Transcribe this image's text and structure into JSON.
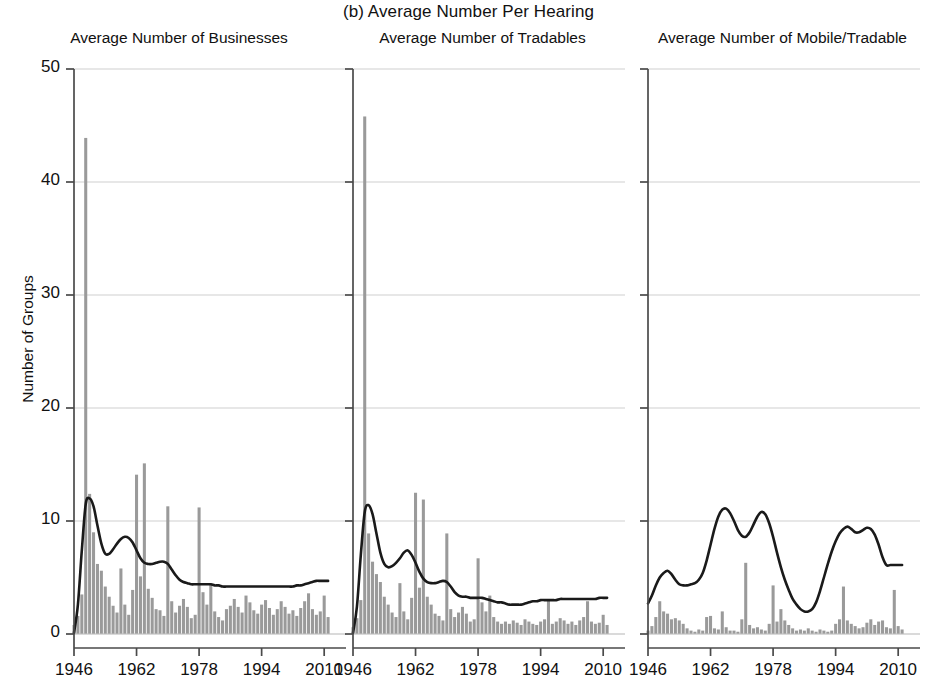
{
  "figure": {
    "main_title": "(b) Average Number Per Hearing",
    "ylabel": "Number of Groups",
    "y_ticks": [
      "0",
      "10",
      "20",
      "30",
      "40",
      "50"
    ],
    "x_ticks": [
      "1946",
      "1962",
      "1978",
      "1994",
      "2010"
    ]
  },
  "chart_data": {
    "type": "bar",
    "title": "(b) Average Number Per Hearing",
    "xlabel": "",
    "ylabel": "Number of Groups",
    "ylim": [
      0,
      50
    ],
    "xlim": [
      1946,
      2012
    ],
    "grid": true,
    "legend": "none",
    "y_tick_values": [
      0,
      10,
      20,
      30,
      40,
      50
    ],
    "x_tick_values": [
      1946,
      1962,
      1978,
      1994,
      2010
    ],
    "panels": [
      {
        "title": "Average Number of Businesses",
        "bar_series_name": "Average Number of Businesses",
        "line_series_name": "smoothed trend",
        "x": [
          1946,
          1947,
          1948,
          1949,
          1950,
          1951,
          1952,
          1953,
          1954,
          1955,
          1956,
          1957,
          1958,
          1959,
          1960,
          1961,
          1962,
          1963,
          1964,
          1965,
          1966,
          1967,
          1968,
          1969,
          1970,
          1971,
          1972,
          1973,
          1974,
          1975,
          1976,
          1977,
          1978,
          1979,
          1980,
          1981,
          1982,
          1983,
          1984,
          1985,
          1986,
          1987,
          1988,
          1989,
          1990,
          1991,
          1992,
          1993,
          1994,
          1995,
          1996,
          1997,
          1998,
          1999,
          2000,
          2001,
          2002,
          2003,
          2004,
          2005,
          2006,
          2007,
          2008,
          2009,
          2010,
          2011
        ],
        "bars": [
          0.8,
          1.6,
          3.5,
          43.9,
          12.4,
          9.0,
          6.2,
          5.6,
          4.2,
          3.3,
          2.5,
          1.9,
          5.8,
          2.6,
          1.7,
          3.9,
          14.1,
          5.1,
          15.1,
          4.0,
          3.2,
          2.2,
          2.1,
          1.6,
          11.3,
          2.9,
          1.9,
          2.5,
          3.1,
          2.4,
          1.4,
          1.7,
          11.2,
          3.7,
          2.6,
          4.5,
          2.0,
          1.5,
          1.2,
          2.2,
          2.5,
          3.1,
          2.4,
          1.9,
          3.4,
          2.8,
          2.1,
          1.8,
          2.6,
          3.0,
          2.3,
          1.7,
          2.2,
          2.9,
          2.4,
          1.8,
          2.1,
          1.6,
          2.3,
          2.9,
          3.6,
          2.2,
          1.7,
          2.0,
          3.4,
          1.5
        ],
        "line": [
          0.1,
          2.6,
          7.4,
          11.5,
          12.0,
          11.3,
          9.6,
          8.0,
          7.1,
          7.1,
          7.5,
          8.0,
          8.4,
          8.6,
          8.5,
          8.1,
          7.4,
          6.7,
          6.3,
          6.2,
          6.2,
          6.3,
          6.4,
          6.4,
          6.2,
          5.7,
          5.2,
          4.8,
          4.6,
          4.5,
          4.4,
          4.4,
          4.4,
          4.4,
          4.4,
          4.4,
          4.3,
          4.3,
          4.2,
          4.2,
          4.2,
          4.2,
          4.2,
          4.2,
          4.2,
          4.2,
          4.2,
          4.2,
          4.2,
          4.2,
          4.2,
          4.2,
          4.2,
          4.2,
          4.2,
          4.2,
          4.2,
          4.3,
          4.3,
          4.4,
          4.5,
          4.6,
          4.7,
          4.7,
          4.7,
          4.7
        ]
      },
      {
        "title": "Average Number of Tradables",
        "bar_series_name": "Average Number of Tradables",
        "line_series_name": "smoothed trend",
        "x": [
          1946,
          1947,
          1948,
          1949,
          1950,
          1951,
          1952,
          1953,
          1954,
          1955,
          1956,
          1957,
          1958,
          1959,
          1960,
          1961,
          1962,
          1963,
          1964,
          1965,
          1966,
          1967,
          1968,
          1969,
          1970,
          1971,
          1972,
          1973,
          1974,
          1975,
          1976,
          1977,
          1978,
          1979,
          1980,
          1981,
          1982,
          1983,
          1984,
          1985,
          1986,
          1987,
          1988,
          1989,
          1990,
          1991,
          1992,
          1993,
          1994,
          1995,
          1996,
          1997,
          1998,
          1999,
          2000,
          2001,
          2002,
          2003,
          2004,
          2005,
          2006,
          2007,
          2008,
          2009,
          2010,
          2011
        ],
        "bars": [
          0.6,
          1.4,
          3.0,
          45.8,
          8.9,
          6.4,
          5.3,
          4.6,
          3.3,
          2.6,
          1.9,
          1.5,
          4.5,
          2.0,
          1.3,
          3.2,
          12.5,
          4.1,
          11.9,
          3.3,
          2.6,
          1.8,
          1.6,
          1.2,
          8.9,
          2.2,
          1.5,
          1.9,
          2.4,
          1.8,
          1.1,
          1.3,
          6.7,
          2.8,
          2.0,
          3.4,
          1.5,
          1.1,
          0.9,
          1.1,
          0.9,
          1.2,
          1.0,
          0.8,
          1.3,
          1.1,
          0.9,
          0.8,
          1.1,
          1.3,
          3.0,
          0.9,
          1.1,
          1.4,
          1.2,
          0.9,
          1.1,
          0.8,
          1.2,
          1.5,
          2.9,
          1.1,
          0.9,
          1.0,
          1.7,
          0.8
        ],
        "line": [
          0.1,
          2.4,
          7.0,
          10.8,
          11.4,
          10.6,
          8.9,
          7.2,
          6.2,
          5.9,
          6.0,
          6.3,
          6.7,
          7.2,
          7.4,
          7.0,
          6.3,
          5.5,
          4.9,
          4.6,
          4.5,
          4.5,
          4.6,
          4.7,
          4.6,
          4.2,
          3.7,
          3.4,
          3.3,
          3.3,
          3.2,
          3.2,
          3.2,
          3.2,
          3.1,
          3.0,
          2.9,
          2.8,
          2.8,
          2.7,
          2.6,
          2.6,
          2.6,
          2.6,
          2.7,
          2.8,
          2.9,
          2.9,
          3.0,
          3.0,
          3.0,
          3.0,
          3.0,
          3.1,
          3.1,
          3.1,
          3.1,
          3.1,
          3.1,
          3.1,
          3.1,
          3.1,
          3.1,
          3.2,
          3.2,
          3.2
        ]
      },
      {
        "title": "Average Number of Mobile/Tradable",
        "bar_series_name": "Average Number of Mobile/Tradable",
        "line_series_name": "smoothed trend",
        "x": [
          1946,
          1947,
          1948,
          1949,
          1950,
          1951,
          1952,
          1953,
          1954,
          1955,
          1956,
          1957,
          1958,
          1959,
          1960,
          1961,
          1962,
          1963,
          1964,
          1965,
          1966,
          1967,
          1968,
          1969,
          1970,
          1971,
          1972,
          1973,
          1974,
          1975,
          1976,
          1977,
          1978,
          1979,
          1980,
          1981,
          1982,
          1983,
          1984,
          1985,
          1986,
          1987,
          1988,
          1989,
          1990,
          1991,
          1992,
          1993,
          1994,
          1995,
          1996,
          1997,
          1998,
          1999,
          2000,
          2001,
          2002,
          2003,
          2004,
          2005,
          2006,
          2007,
          2008,
          2009,
          2010,
          2011
        ],
        "bars": [
          0.3,
          0.7,
          1.5,
          2.9,
          2.0,
          1.8,
          1.3,
          1.4,
          1.2,
          0.9,
          0.5,
          0.3,
          0.2,
          0.4,
          0.3,
          1.5,
          1.6,
          0.5,
          0.4,
          2.0,
          0.6,
          0.3,
          0.3,
          0.2,
          1.3,
          6.3,
          0.8,
          0.5,
          0.6,
          0.4,
          0.3,
          0.9,
          4.3,
          1.1,
          2.2,
          1.2,
          0.8,
          0.5,
          0.3,
          0.4,
          0.3,
          0.5,
          0.3,
          0.2,
          0.4,
          0.3,
          0.2,
          0.3,
          0.9,
          1.3,
          4.2,
          1.2,
          0.9,
          0.7,
          0.5,
          0.6,
          1.0,
          1.3,
          0.8,
          1.1,
          1.2,
          0.6,
          0.5,
          3.9,
          0.7,
          0.4
        ],
        "line": [
          2.7,
          3.4,
          4.3,
          5.0,
          5.4,
          5.6,
          5.3,
          4.8,
          4.4,
          4.3,
          4.3,
          4.4,
          4.5,
          4.8,
          5.4,
          6.5,
          7.9,
          9.3,
          10.4,
          11.0,
          11.1,
          10.7,
          10.0,
          9.2,
          8.7,
          8.6,
          9.0,
          9.7,
          10.4,
          10.8,
          10.6,
          9.8,
          8.6,
          7.2,
          5.9,
          4.8,
          3.9,
          3.1,
          2.6,
          2.2,
          2.0,
          2.0,
          2.2,
          2.8,
          3.8,
          5.0,
          6.2,
          7.3,
          8.2,
          8.9,
          9.3,
          9.5,
          9.3,
          9.0,
          9.0,
          9.2,
          9.4,
          9.3,
          8.8,
          7.9,
          6.8,
          6.1,
          6.1,
          6.1,
          6.1,
          6.1
        ]
      }
    ]
  }
}
